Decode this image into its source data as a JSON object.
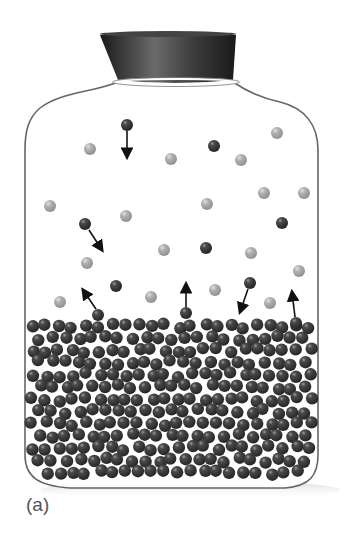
{
  "figure": {
    "label": "(a)",
    "colors": {
      "liquid_molecule": "#3a3a3a",
      "vapor_molecule_dark": "#3a3a3a",
      "vapor_molecule_light": "#a9a9a9",
      "bottle_outline": "#666666",
      "stopper": "#2e2e2e",
      "arrow": "#111111"
    },
    "stopper": {
      "top": [
        [
          100,
          33
        ],
        [
          236,
          33
        ]
      ],
      "bottom": [
        [
          118,
          80
        ],
        [
          233,
          80
        ]
      ]
    },
    "vapor_molecules": [
      {
        "x": 127,
        "y": 125,
        "shade": "dark"
      },
      {
        "x": 90,
        "y": 149,
        "shade": "light"
      },
      {
        "x": 171,
        "y": 159,
        "shade": "light"
      },
      {
        "x": 214,
        "y": 146,
        "shade": "dark"
      },
      {
        "x": 277,
        "y": 133,
        "shade": "light"
      },
      {
        "x": 241,
        "y": 160,
        "shade": "light"
      },
      {
        "x": 264,
        "y": 193,
        "shade": "light"
      },
      {
        "x": 304,
        "y": 193,
        "shade": "light"
      },
      {
        "x": 50,
        "y": 206,
        "shade": "light"
      },
      {
        "x": 126,
        "y": 216,
        "shade": "light"
      },
      {
        "x": 207,
        "y": 204,
        "shade": "light"
      },
      {
        "x": 85,
        "y": 224,
        "shade": "dark"
      },
      {
        "x": 282,
        "y": 223,
        "shade": "dark"
      },
      {
        "x": 87,
        "y": 263,
        "shade": "light"
      },
      {
        "x": 164,
        "y": 250,
        "shade": "light"
      },
      {
        "x": 206,
        "y": 248,
        "shade": "dark"
      },
      {
        "x": 251,
        "y": 253,
        "shade": "light"
      },
      {
        "x": 299,
        "y": 271,
        "shade": "light"
      },
      {
        "x": 116,
        "y": 286,
        "shade": "dark"
      },
      {
        "x": 60,
        "y": 302,
        "shade": "light"
      },
      {
        "x": 151,
        "y": 297,
        "shade": "light"
      },
      {
        "x": 215,
        "y": 290,
        "shade": "light"
      },
      {
        "x": 250,
        "y": 283,
        "shade": "dark"
      },
      {
        "x": 270,
        "y": 303,
        "shade": "light"
      },
      {
        "x": 98,
        "y": 315,
        "shade": "dark"
      },
      {
        "x": 186,
        "y": 313,
        "shade": "dark"
      },
      {
        "x": 296,
        "y": 323,
        "shade": "dark"
      }
    ],
    "arrows": [
      {
        "from": [
          127,
          131
        ],
        "to": [
          127,
          157
        ],
        "meaning": "condensing"
      },
      {
        "from": [
          89,
          230
        ],
        "to": [
          102,
          250
        ],
        "meaning": "condensing"
      },
      {
        "from": [
          96,
          309
        ],
        "to": [
          83,
          290
        ],
        "meaning": "evaporating"
      },
      {
        "from": [
          186,
          307
        ],
        "to": [
          186,
          284
        ],
        "meaning": "evaporating"
      },
      {
        "from": [
          248,
          289
        ],
        "to": [
          240,
          312
        ],
        "meaning": "condensing"
      },
      {
        "from": [
          295,
          317
        ],
        "to": [
          292,
          292
        ],
        "meaning": "evaporating"
      }
    ],
    "liquid": {
      "top_y": 322,
      "bottom_y": 485,
      "left_x": 30,
      "right_x": 314,
      "molecule_radius": 6.2,
      "count_hint": 330
    }
  }
}
